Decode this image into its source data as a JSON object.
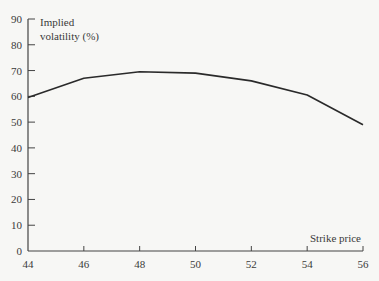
{
  "chart_data": {
    "type": "line",
    "title": "",
    "xlabel": "Strike price",
    "ylabel": "Implied volatility (%)",
    "ylabel_lines": [
      "Implied",
      "volatility (%)"
    ],
    "x": [
      44,
      46,
      48,
      50,
      52,
      54,
      56
    ],
    "series": [
      {
        "name": "Implied volatility",
        "values": [
          59.5,
          67,
          69.5,
          69,
          66,
          60.5,
          49
        ]
      }
    ],
    "xlim": [
      44,
      56
    ],
    "ylim": [
      0,
      90
    ],
    "xticks": [
      44,
      46,
      48,
      50,
      52,
      54,
      56
    ],
    "yticks": [
      0,
      10,
      20,
      30,
      40,
      50,
      60,
      70,
      80,
      90
    ],
    "grid": false,
    "legend": null,
    "line_color": "#2a2a2a",
    "axis_color": "#444444"
  }
}
